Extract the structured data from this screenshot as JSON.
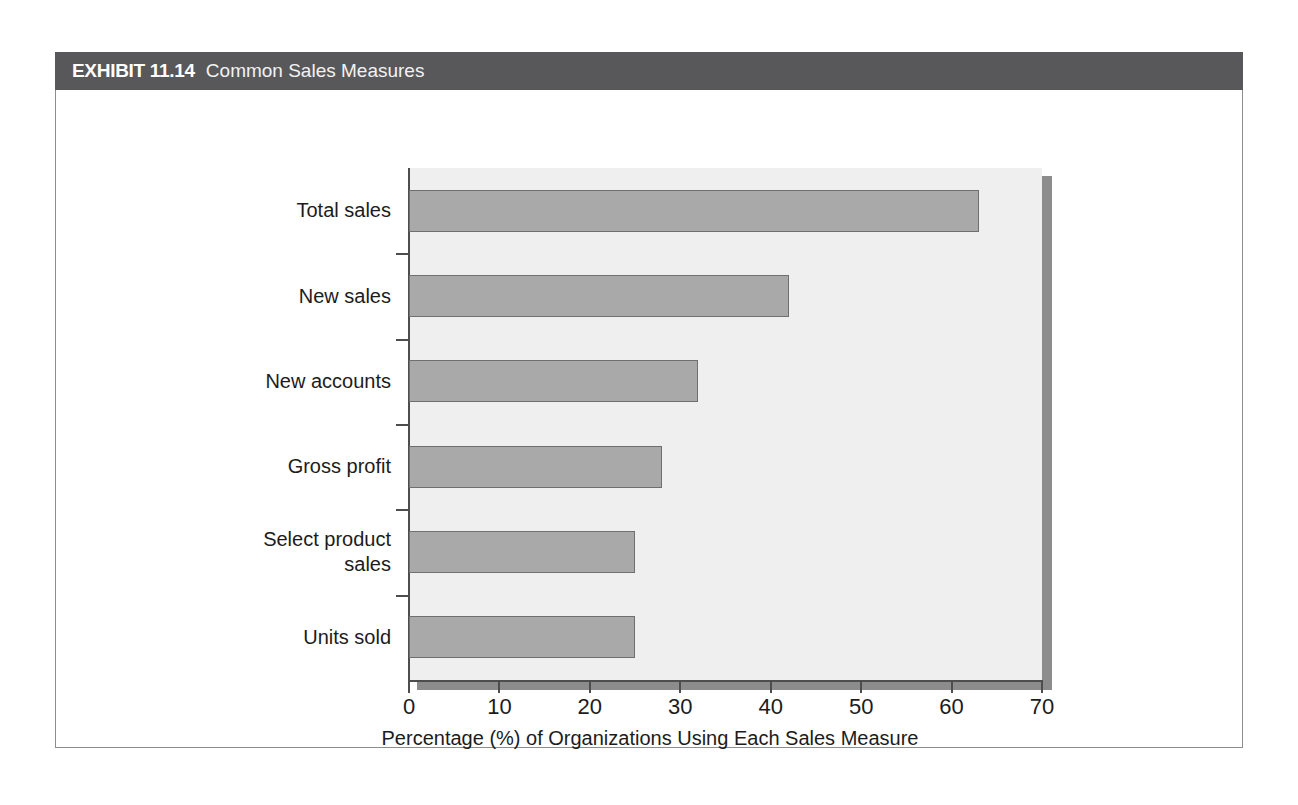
{
  "exhibit": {
    "number": "EXHIBIT 11.14",
    "title": "Common Sales Measures"
  },
  "colors": {
    "header_band": "#58585a",
    "bar_fill": "#a9a9a9",
    "bar_edge": "#6f6f6f",
    "plot_background": "#efefef",
    "shadow": "#8c8c8c",
    "axis": "#4d4d4d",
    "frame_border": "#8d8d8d"
  },
  "chart_data": {
    "type": "bar",
    "orientation": "horizontal",
    "title": "Common Sales Measures",
    "subtitle": "",
    "categories": [
      "Total sales",
      "New sales",
      "New accounts",
      "Gross profit",
      "Select product sales",
      "Units sold"
    ],
    "values": [
      63,
      42,
      32,
      28,
      25,
      25
    ],
    "xlabel": "Percentage (%) of Organizations Using Each Sales Measure",
    "ylabel": "",
    "xlim": [
      0,
      70
    ],
    "ylim": [
      0,
      6
    ],
    "xticks": [
      0,
      10,
      20,
      30,
      40,
      50,
      60,
      70
    ],
    "xtick_labels": [
      "0",
      "10",
      "20",
      "30",
      "40",
      "50",
      "60",
      "70"
    ],
    "grid": false,
    "legend": false,
    "legend_position": "none"
  },
  "category_label_lines": [
    [
      "Total sales"
    ],
    [
      "New sales"
    ],
    [
      "New accounts"
    ],
    [
      "Gross profit"
    ],
    [
      "Select product",
      "sales"
    ],
    [
      "Units sold"
    ]
  ]
}
